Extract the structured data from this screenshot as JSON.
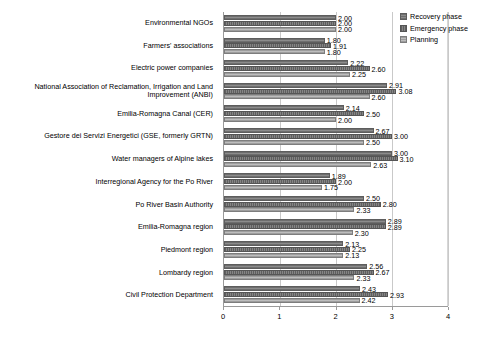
{
  "chart_data": {
    "type": "bar",
    "orientation": "horizontal",
    "title": "",
    "xlabel": "",
    "ylabel": "",
    "xlim": [
      0,
      4
    ],
    "xticks": [
      0,
      1,
      2,
      3,
      4
    ],
    "xtick_labels": [
      "0",
      "1",
      "2",
      "3",
      "4"
    ],
    "grid": true,
    "grid_axis": "x",
    "legend_position": "top-right",
    "value_label_format": "0.00",
    "categories": [
      "Environmental NGOs",
      "Farmers' associations",
      "Electric power companies",
      "National Association of Reclamation, Irrigation and Land Improvement (ANBI)",
      "Emilia-Romagna Canal (CER)",
      "Gestore dei Servizi Energetici (GSE, formerly GRTN)",
      "Water managers of Alpine lakes",
      "Interregional Agency for the Po River",
      "Po River Basin Authority",
      "Emilia-Romagna region",
      "Piedmont region",
      "Lombardy region",
      "Civil Protection Department"
    ],
    "series": [
      {
        "name": "Recovery phase",
        "color": "#7b7b7b",
        "values": [
          2.0,
          1.8,
          2.22,
          2.91,
          2.14,
          2.67,
          3.0,
          1.89,
          2.5,
          2.89,
          2.13,
          2.56,
          2.43
        ]
      },
      {
        "name": "Emergency phase",
        "color": "#6b6b6b",
        "values": [
          2.0,
          1.91,
          2.6,
          3.08,
          2.5,
          3.0,
          3.1,
          2.0,
          2.8,
          2.89,
          2.25,
          2.67,
          2.93
        ]
      },
      {
        "name": "Planning",
        "color": "#ababab",
        "values": [
          2.0,
          1.8,
          2.25,
          2.6,
          2.0,
          2.5,
          2.63,
          1.75,
          2.33,
          2.3,
          2.13,
          2.33,
          2.42
        ]
      }
    ]
  },
  "legend": {
    "items": [
      {
        "label": "Recovery phase"
      },
      {
        "label": "Emergency phase"
      },
      {
        "label": "Planning"
      }
    ]
  }
}
